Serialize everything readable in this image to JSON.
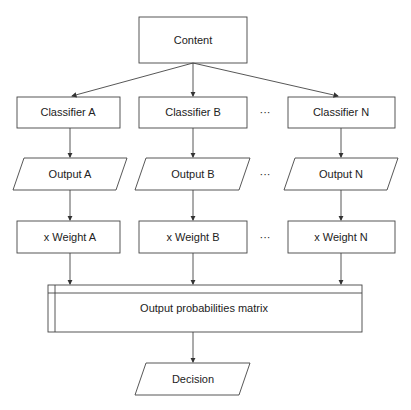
{
  "diagram": {
    "content": "Content",
    "classifiers": [
      {
        "label": "Classifier A",
        "output": "Output A",
        "weight": "x Weight A"
      },
      {
        "label": "Classifier B",
        "output": "Output B",
        "weight": "x Weight B"
      },
      {
        "label": "Classifier N",
        "output": "Output N",
        "weight": "x Weight N"
      }
    ],
    "ellipsis": "···",
    "matrix": "Output probabilities matrix",
    "decision": "Decision"
  }
}
